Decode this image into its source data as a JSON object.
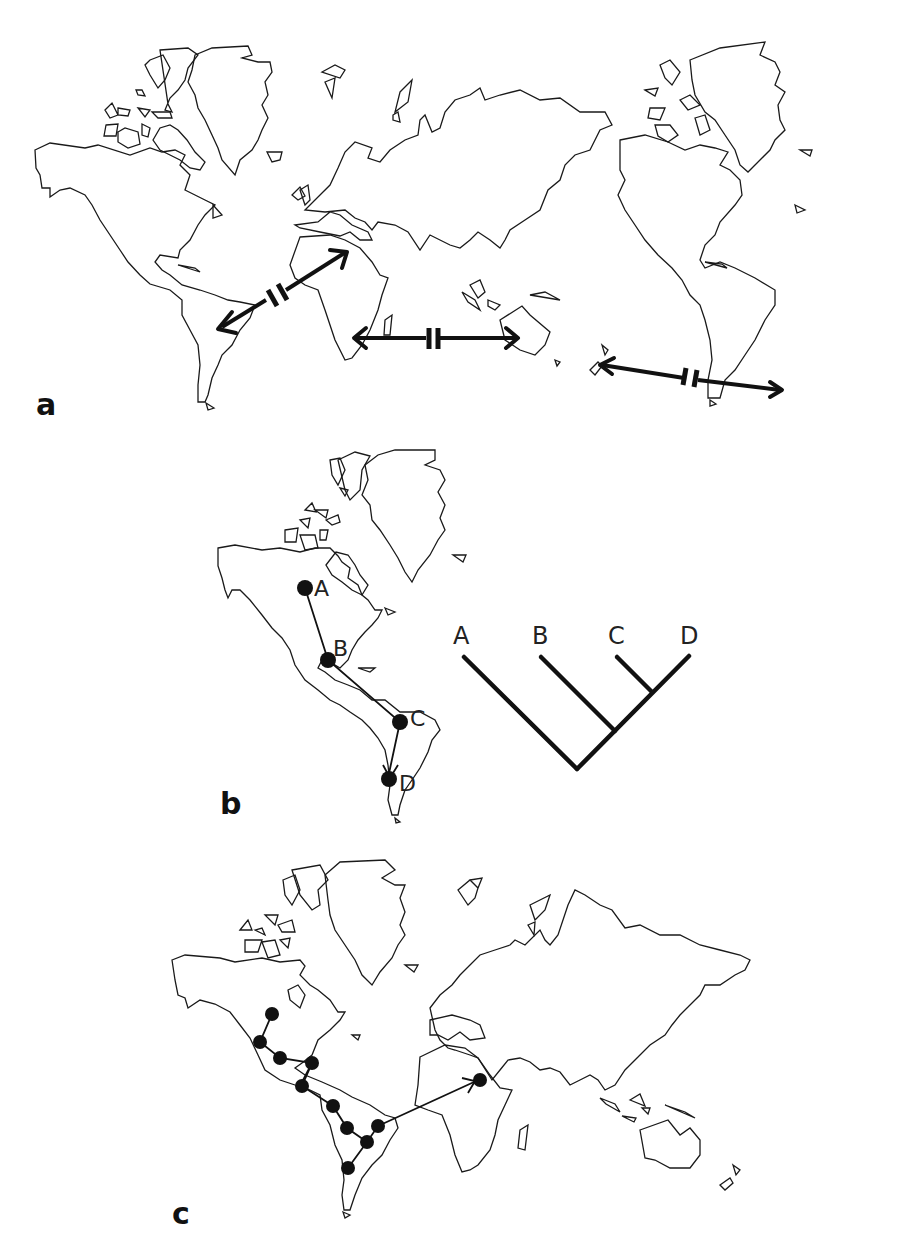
{
  "figure": {
    "panels": [
      {
        "id": "a",
        "label": "a",
        "description": "World map (Pacific-centred, Americas repeated) with three double-headed arrows interrupted by a break symbol, representing vicariance/disjunction between continents",
        "arrows": [
          {
            "from": "South America",
            "to": "Africa (North)",
            "style": "double-headed with break"
          },
          {
            "from": "Southern Africa",
            "to": "Australia",
            "style": "double-headed with break"
          },
          {
            "from": "New Zealand",
            "to": "Southern South America",
            "style": "double-headed with break"
          }
        ]
      },
      {
        "id": "b",
        "label": "b",
        "description": "Americas map with four localities A-D connected by a dispersal path, alongside a cladogram",
        "map_nodes": [
          {
            "label": "A",
            "region": "North America (interior)"
          },
          {
            "label": "B",
            "region": "Central America / Mexico"
          },
          {
            "label": "C",
            "region": "Eastern South America"
          },
          {
            "label": "D",
            "region": "Southern South America"
          }
        ],
        "cladogram": {
          "tips": [
            "A",
            "B",
            "C",
            "D"
          ],
          "topology": "(A,(B,(C,D)))"
        }
      },
      {
        "id": "c",
        "label": "c",
        "description": "Map of Americas, Europe, Africa, Asia and Australia showing a chain of localities through North and South America with a dispersal arrow to Africa",
        "node_count": 11,
        "dispersal_arrow": {
          "from": "Eastern South America",
          "to": "Northern Africa"
        }
      }
    ]
  }
}
